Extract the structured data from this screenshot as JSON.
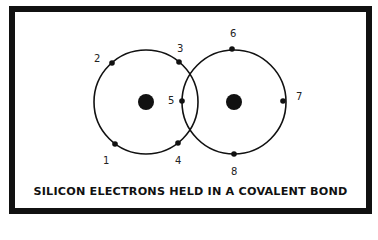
{
  "diagram": {
    "caption": "SILICON ELECTRONS HELD IN A COVALENT BOND",
    "colors": {
      "line": "#111111",
      "background": "#ffffff",
      "label": "#222222"
    },
    "atoms": [
      {
        "name": "left-atom",
        "cx": 146,
        "cy": 102,
        "r": 52,
        "nucleus_r": 8
      },
      {
        "name": "right-atom",
        "cx": 234,
        "cy": 102,
        "r": 52,
        "nucleus_r": 8
      }
    ],
    "electrons": [
      {
        "label": "1",
        "x": 115,
        "y": 144,
        "lx": 103,
        "ly": 164
      },
      {
        "label": "2",
        "x": 112,
        "y": 63,
        "lx": 94,
        "ly": 62
      },
      {
        "label": "3",
        "x": 179,
        "y": 62,
        "lx": 177,
        "ly": 52
      },
      {
        "label": "4",
        "x": 178,
        "y": 143,
        "lx": 175,
        "ly": 164
      },
      {
        "label": "5",
        "x": 182,
        "y": 101,
        "lx": 168,
        "ly": 104
      },
      {
        "label": "6",
        "x": 232,
        "y": 49,
        "lx": 230,
        "ly": 37
      },
      {
        "label": "7",
        "x": 283,
        "y": 101,
        "lx": 296,
        "ly": 100
      },
      {
        "label": "8",
        "x": 234,
        "y": 154,
        "lx": 231,
        "ly": 175
      }
    ]
  }
}
